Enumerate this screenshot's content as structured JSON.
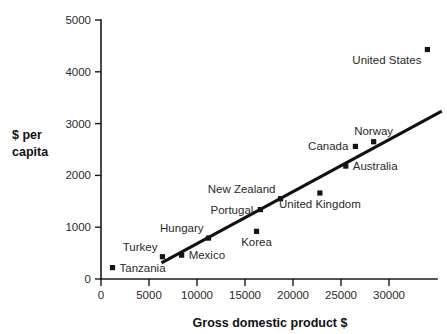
{
  "chart_data": {
    "type": "scatter",
    "title": "",
    "xlabel": "Gross domestic product $",
    "ylabel": "$ per capita",
    "ylabel_lines": [
      "$ per",
      "capita"
    ],
    "xlim": [
      0,
      35000
    ],
    "ylim": [
      0,
      5000
    ],
    "xticks": [
      0,
      5000,
      10000,
      15000,
      20000,
      25000,
      30000
    ],
    "xtick_labels": [
      "0",
      "5000",
      "10000",
      "15000",
      "20000",
      "25000",
      "30000"
    ],
    "yticks": [
      0,
      1000,
      2000,
      3000,
      4000,
      5000
    ],
    "ytick_labels": [
      "0",
      "1000",
      "2000",
      "3000",
      "4000",
      "5000"
    ],
    "grid": false,
    "legend": "none",
    "marker_shape": "square",
    "marker_color": "#141414",
    "line_color": "#111111",
    "points": [
      {
        "label": "Tanzania",
        "x": 1200,
        "y": 220,
        "label_pos": "right"
      },
      {
        "label": "Turkey",
        "x": 6400,
        "y": 430,
        "label_pos": "upper-left"
      },
      {
        "label": "Mexico",
        "x": 8400,
        "y": 460,
        "label_pos": "right"
      },
      {
        "label": "Hungary",
        "x": 11200,
        "y": 790,
        "label_pos": "upper-left"
      },
      {
        "label": "Korea",
        "x": 16200,
        "y": 920,
        "label_pos": "below"
      },
      {
        "label": "Portugal",
        "x": 16600,
        "y": 1340,
        "label_pos": "left"
      },
      {
        "label": "New Zealand",
        "x": 18700,
        "y": 1550,
        "label_pos": "upper-left"
      },
      {
        "label": "United Kingdom",
        "x": 22800,
        "y": 1660,
        "label_pos": "below"
      },
      {
        "label": "Australia",
        "x": 25500,
        "y": 2180,
        "label_pos": "right"
      },
      {
        "label": "Canada",
        "x": 26500,
        "y": 2560,
        "label_pos": "left"
      },
      {
        "label": "Norway",
        "x": 28400,
        "y": 2650,
        "label_pos": "above"
      },
      {
        "label": "United States",
        "x": 34000,
        "y": 4430,
        "label_pos": "below-left"
      }
    ],
    "trend_line": {
      "x_start": 6300,
      "y_start": 310,
      "x_end": 35500,
      "y_end": 3240
    }
  },
  "labels": {
    "tanzania": "Tanzania",
    "turkey": "Turkey",
    "mexico": "Mexico",
    "hungary": "Hungary",
    "korea": "Korea",
    "portugal": "Portugal",
    "new_zealand": "New Zealand",
    "united_kingdom": "United Kingdom",
    "australia": "Australia",
    "canada": "Canada",
    "norway": "Norway",
    "united_states": "United States"
  }
}
